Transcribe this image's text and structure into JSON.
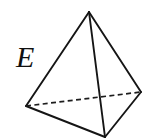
{
  "figure": {
    "name": "tetrahedron-solid",
    "background_color": "#ffffff",
    "width": 148,
    "height": 139,
    "labels": [
      {
        "id": "E",
        "text": "E",
        "style": "italic-serif",
        "x": 16,
        "y": 42,
        "font_size": 30,
        "color": "#101010"
      }
    ],
    "geometry": {
      "vertices": {
        "apex": {
          "x": 89,
          "y": 12
        },
        "back_left": {
          "x": 26,
          "y": 106
        },
        "back_right": {
          "x": 141,
          "y": 92
        },
        "front_bottom": {
          "x": 105,
          "y": 137
        }
      },
      "edges": [
        {
          "name": "apex-to-back-left",
          "from": "apex",
          "to": "back_left",
          "style": "solid"
        },
        {
          "name": "apex-to-back-right",
          "from": "apex",
          "to": "back_right",
          "style": "solid"
        },
        {
          "name": "apex-to-front-bottom",
          "from": "apex",
          "to": "front_bottom",
          "style": "solid"
        },
        {
          "name": "back-left-to-front-bottom",
          "from": "back_left",
          "to": "front_bottom",
          "style": "solid"
        },
        {
          "name": "back-right-to-front-bottom",
          "from": "back_right",
          "to": "front_bottom",
          "style": "solid"
        },
        {
          "name": "back-left-to-back-right",
          "from": "back_left",
          "to": "back_right",
          "style": "dashed"
        }
      ],
      "stroke_color": "#151515",
      "hidden_stroke_color": "#1d1d1d",
      "stroke_width": 1.9,
      "dash_pattern": "5 3.4"
    }
  }
}
